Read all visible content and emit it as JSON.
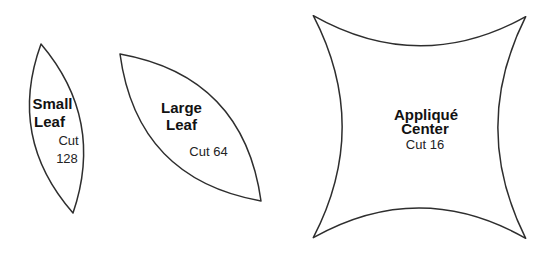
{
  "page": {
    "background_color": "#ffffff",
    "outline_color": "#2e2e2e",
    "text_color": "#121212"
  },
  "shapes": {
    "small_leaf": {
      "title_line1": "Small",
      "title_line2": "Leaf",
      "cut_line1": "Cut",
      "cut_line2": "128"
    },
    "large_leaf": {
      "title_line1": "Large",
      "title_line2": "Leaf",
      "cut": "Cut 64"
    },
    "applique_center": {
      "title_line1": "Appliqué",
      "title_line2": "Center",
      "cut": "Cut 16"
    }
  }
}
